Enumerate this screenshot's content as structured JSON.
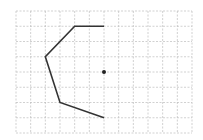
{
  "diagram": {
    "grid": {
      "cols": 12,
      "rows": 8,
      "x0": 16,
      "y0": 11,
      "x1": 192,
      "y1": 133,
      "line_color": "#bdbdbd"
    },
    "polyline": {
      "color": "#333333",
      "points_grid": [
        [
          6,
          1
        ],
        [
          4,
          1
        ],
        [
          2,
          3
        ],
        [
          3,
          6
        ],
        [
          6,
          7
        ]
      ]
    },
    "center_point": {
      "grid": [
        6,
        4
      ],
      "color": "#222222"
    }
  }
}
